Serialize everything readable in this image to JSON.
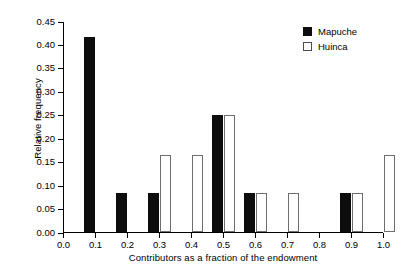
{
  "chart_data": {
    "type": "bar",
    "title": "",
    "xlabel": "Contributors as a fraction of the endowment",
    "ylabel": "Relative frequency",
    "categories": [
      "0.0",
      "0.1",
      "0.2",
      "0.3",
      "0.4",
      "0.5",
      "0.6",
      "0.7",
      "0.8",
      "0.9",
      "1.0"
    ],
    "series": [
      {
        "name": "Mapuche",
        "color": "#0d0d0d",
        "fill": "solid",
        "values": [
          0,
          0.415,
          0.083,
          0.083,
          0,
          0.25,
          0.083,
          0,
          0,
          0.083,
          0
        ]
      },
      {
        "name": "Huinca",
        "color": "#ffffff",
        "fill": "open",
        "values": [
          0,
          0,
          0,
          0.165,
          0.165,
          0.25,
          0.083,
          0.083,
          0,
          0.083,
          0.165
        ]
      }
    ],
    "xlim": [
      0.0,
      1.0
    ],
    "ylim": [
      0.0,
      0.45
    ],
    "ytick_labels": [
      "0.00",
      "0.05",
      "0.10",
      "0.15",
      "0.20",
      "0.25",
      "0.30",
      "0.35",
      "0.40",
      "0.45"
    ],
    "ytick_values": [
      0.0,
      0.05,
      0.1,
      0.15,
      0.2,
      0.25,
      0.3,
      0.35,
      0.4,
      0.45
    ],
    "xtick_labels": [
      "0.0",
      "0.1",
      "0.2",
      "0.3",
      "0.4",
      "0.5",
      "0.6",
      "0.7",
      "0.8",
      "0.9",
      "1.0"
    ],
    "xtick_values": [
      0.0,
      0.1,
      0.2,
      0.3,
      0.4,
      0.5,
      0.6,
      0.7,
      0.8,
      0.9,
      1.0
    ],
    "grid": false,
    "legend_position": "top-right",
    "legend": [
      "Mapuche",
      "Huinca"
    ]
  }
}
